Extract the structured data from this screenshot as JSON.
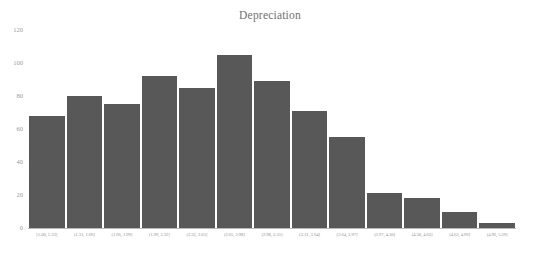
{
  "chart_data": {
    "type": "bar",
    "title": "Depreciation",
    "subtitle": "",
    "xlabel": "",
    "ylabel": "",
    "grid": false,
    "legend": null,
    "orientation": "vertical",
    "bar_color": "#585858",
    "bar_edge_color": "#ffffff",
    "text_color": "#8f8f8f",
    "background_color": "#ffffff",
    "ylim": [
      0,
      120
    ],
    "yticks": [
      0,
      20,
      40,
      60,
      80,
      100,
      120
    ],
    "ytick_labels": [
      "0",
      "20",
      "40",
      "60",
      "80",
      "100",
      "120"
    ],
    "bin_width": 0.33,
    "categories": [
      "[1.00, 1.33]",
      "(1.33, 1.66]",
      "(1.66, 1.99]",
      "(1.99, 2.32]",
      "(2.32, 2.65]",
      "(2.65, 2.98]",
      "(2.98, 3.31]",
      "(3.31, 3.64]",
      "(3.64, 3.97]",
      "(3.97, 4.30]",
      "(4.30, 4.63]",
      "(4.63, 4.96]",
      "(4.96, 5.29]"
    ],
    "values": [
      68,
      80,
      75,
      92,
      85,
      105,
      89,
      71,
      55,
      21,
      18,
      10,
      3
    ],
    "bins": [
      {
        "label": "[1.00, 1.33]",
        "value": 68
      },
      {
        "label": "(1.33, 1.66]",
        "value": 80
      },
      {
        "label": "(1.66, 1.99]",
        "value": 75
      },
      {
        "label": "(1.99, 2.32]",
        "value": 92
      },
      {
        "label": "(2.32, 2.65]",
        "value": 85
      },
      {
        "label": "(2.65, 2.98]",
        "value": 105
      },
      {
        "label": "(2.98, 3.31]",
        "value": 89
      },
      {
        "label": "(3.31, 3.64]",
        "value": 71
      },
      {
        "label": "(3.64, 3.97]",
        "value": 55
      },
      {
        "label": "(3.97, 4.30]",
        "value": 21
      },
      {
        "label": "(4.30, 4.63]",
        "value": 18
      },
      {
        "label": "(4.63, 4.96]",
        "value": 10
      },
      {
        "label": "(4.96, 5.29]",
        "value": 3
      }
    ]
  }
}
